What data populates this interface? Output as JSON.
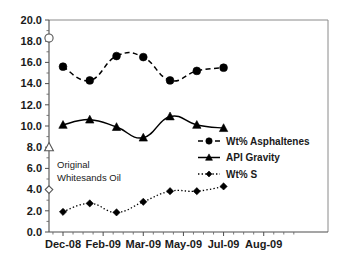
{
  "chart_data": {
    "type": "line",
    "title": "",
    "subtitle": "",
    "xlabel": "",
    "ylabel": "",
    "ylim": [
      0.0,
      20.0
    ],
    "ytick_step": 2.0,
    "ytick_labels": [
      "0.0",
      "2.0",
      "4.0",
      "6.0",
      "8.0",
      "10.0",
      "12.0",
      "14.0",
      "16.0",
      "18.0",
      "20.0"
    ],
    "ytick_values": [
      0.0,
      2.0,
      4.0,
      6.0,
      8.0,
      10.0,
      12.0,
      14.0,
      16.0,
      18.0,
      20.0
    ],
    "xtick_labels": [
      "Dec-08",
      "Feb-09",
      "Mar-09",
      "May-09",
      "Jul-09",
      "Aug-09"
    ],
    "grid": false,
    "legend_position": "inside-right-middle",
    "categories": [
      "Dec-08",
      "Jan-09",
      "Feb-09",
      "Mar-09",
      "Apr-09",
      "May-09",
      "Jun-09"
    ],
    "series": [
      {
        "name": "Wt% Asphaltenes",
        "marker": "circle",
        "linestyle": "dashed",
        "values": [
          15.6,
          14.3,
          16.6,
          16.5,
          14.3,
          15.2,
          15.5
        ]
      },
      {
        "name": "API Gravity",
        "marker": "triangle",
        "linestyle": "solid",
        "values": [
          10.1,
          10.6,
          9.9,
          8.9,
          10.9,
          10.1,
          9.8
        ]
      },
      {
        "name": "Wt% S",
        "marker": "diamond",
        "linestyle": "dotted",
        "values": [
          1.9,
          2.7,
          1.85,
          2.85,
          3.85,
          3.85,
          4.3
        ]
      }
    ],
    "reference_points": [
      {
        "label": "Wt% Asphaltenes",
        "marker": "circle-open",
        "value": 18.3
      },
      {
        "label": "API Gravity",
        "marker": "triangle-open",
        "value": 8.0
      },
      {
        "label": "Wt% S",
        "marker": "diamond-open",
        "value": 4.0
      }
    ],
    "annotations": [
      {
        "line1": "Original",
        "line2": "Whitesands Oil"
      }
    ]
  },
  "legend": {
    "entries": [
      {
        "label": "Wt% Asphaltenes"
      },
      {
        "label": "API Gravity"
      },
      {
        "label": "Wt% S"
      }
    ]
  },
  "annotation": {
    "line1": "Original",
    "line2": "Whitesands Oil"
  },
  "axes": {
    "y_labels": [
      "20.0",
      "18.0",
      "16.0",
      "14.0",
      "12.0",
      "10.0",
      "8.0",
      "6.0",
      "4.0",
      "2.0",
      "0.0"
    ],
    "x_labels": [
      "Dec-08",
      "Feb-09",
      "Mar-09",
      "May-09",
      "Jul-09",
      "Aug-09"
    ]
  }
}
